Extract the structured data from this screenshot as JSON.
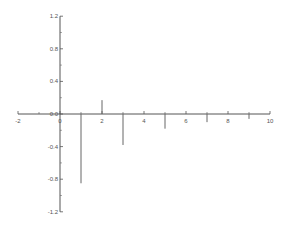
{
  "chart_data": {
    "type": "stem",
    "title": "",
    "xlabel": "",
    "ylabel": "",
    "xlim": [
      -2,
      10
    ],
    "ylim": [
      -1.2,
      1.2
    ],
    "grid": false,
    "legend": null,
    "x": [
      1,
      2,
      3,
      5,
      7,
      9
    ],
    "values": [
      -0.85,
      0.17,
      -0.38,
      -0.18,
      -0.1,
      -0.06
    ],
    "x_ticks": [
      -2,
      0,
      2,
      4,
      6,
      8,
      10
    ],
    "x_minor_ticks": [
      -1,
      1,
      3,
      5,
      7,
      9
    ],
    "x_tick_labels": [
      "-2",
      "0",
      "2",
      "4",
      "6",
      "8",
      "10"
    ],
    "y_ticks": [
      1.2,
      0.8,
      0.4,
      0.0,
      -0.4,
      -0.8,
      -1.2
    ],
    "y_tick_labels": [
      "1.2",
      "0.8",
      "0.4",
      "0.0",
      "-0.4",
      "-0.8",
      "-1.2"
    ],
    "colors": {
      "axis": "#555555",
      "stem": "#666666",
      "text": "#555555"
    }
  }
}
